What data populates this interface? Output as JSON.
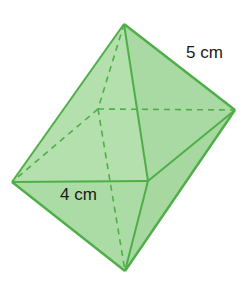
{
  "figure": {
    "type": "octahedron",
    "colors": {
      "face_fill": "#a8dba0",
      "edge_stroke": "#4fae48",
      "label_text": "#1a1a1a"
    }
  },
  "labels": {
    "slant_edge": "5 cm",
    "base_edge": "4 cm"
  }
}
